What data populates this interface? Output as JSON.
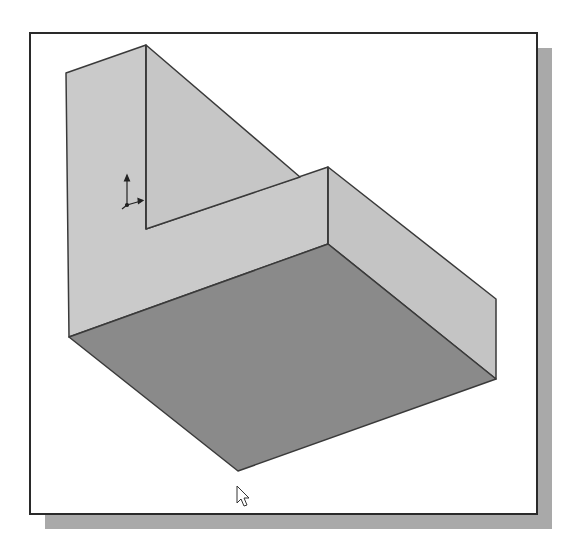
{
  "figure": {
    "colors": {
      "wall_face": "#c9c9c9",
      "wall_face_right": "#c4c4c4",
      "floor_face": "#8a8a8a",
      "edge": "#3a3a3a",
      "frame_border": "#2a2a2a",
      "shadow": "#a9a9a9",
      "background": "#ffffff"
    },
    "vertices": {
      "peak_top": [
        146,
        45
      ],
      "left_top": [
        66,
        73
      ],
      "left_floor": [
        69,
        337
      ],
      "inner_corner": [
        147,
        229
      ],
      "step_top": [
        328,
        167
      ],
      "step_floor": [
        328,
        244
      ],
      "right_top": [
        496,
        299
      ],
      "right_floor": [
        496,
        379
      ],
      "floor_front": [
        238,
        471
      ]
    },
    "icons": {
      "triad": "coordinate-triad-icon",
      "cursor": "mouse-pointer-icon"
    }
  }
}
